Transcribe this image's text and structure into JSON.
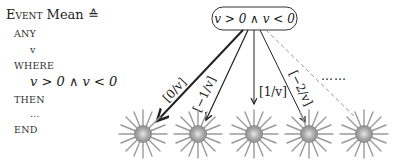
{
  "event_spec": {
    "header_keyword": "Event",
    "event_name": "Mean",
    "def_symbol": "≙",
    "any_keyword": "ANY",
    "parameter": "v",
    "where_keyword": "WHERE",
    "guard": "v > 0 ∧ v < 0",
    "then_keyword": "THEN",
    "action": "…",
    "end_keyword": "END"
  },
  "tree": {
    "root_label": "v > 0 ∧ v < 0",
    "edges": [
      {
        "label": "[0/v]",
        "style": "solid-thick"
      },
      {
        "label": "[−1/v]",
        "style": "solid"
      },
      {
        "label": "[1/v]",
        "style": "solid"
      },
      {
        "label": "[−2/v]",
        "style": "solid"
      },
      {
        "label": "",
        "style": "dashed"
      }
    ],
    "ellipsis": "……",
    "leaf_icon": "starburst-icon"
  }
}
